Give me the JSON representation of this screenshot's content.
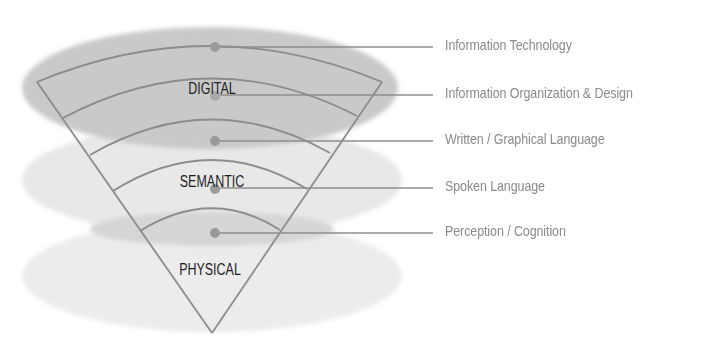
{
  "diagram": {
    "title": "",
    "layers": [
      {
        "name": "DIGITAL",
        "ellipse_color": "#c8c8c8"
      },
      {
        "name": "SEMANTIC",
        "ellipse_color": "#e6e6e6"
      },
      {
        "name": "PHYSICAL",
        "ellipse_color": "#ebebeb"
      }
    ],
    "layer_labels": {
      "digital": "DIGITAL",
      "semantic": "SEMANTIC",
      "physical": "PHYSICAL"
    },
    "levels": [
      {
        "label": "Information Technology"
      },
      {
        "label": "Information Organization & Design"
      },
      {
        "label": "Written / Graphical Language"
      },
      {
        "label": "Spoken Language"
      },
      {
        "label": "Perception / Cognition"
      }
    ],
    "colors": {
      "cone_stroke": "#8c8c8c",
      "leader_line": "#8e8e8e",
      "dot": "#9a9a9a",
      "label_text": "#8a8a8a",
      "layer_text": "#1e1e1e",
      "band_ellipse": "#d6d6d6"
    }
  }
}
